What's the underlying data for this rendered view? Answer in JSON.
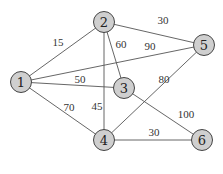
{
  "diagram": {
    "type": "weighted-undirected-graph",
    "colors": {
      "node_fill": "#cfcfcf",
      "node_stroke": "#444444",
      "edge": "#555555",
      "text": "#222222"
    },
    "nodes": [
      {
        "id": "1",
        "label": "1",
        "x": 21,
        "y": 82
      },
      {
        "id": "2",
        "label": "2",
        "x": 104,
        "y": 22
      },
      {
        "id": "3",
        "label": "3",
        "x": 124,
        "y": 88
      },
      {
        "id": "4",
        "label": "4",
        "x": 104,
        "y": 140
      },
      {
        "id": "5",
        "label": "5",
        "x": 204,
        "y": 45
      },
      {
        "id": "6",
        "label": "6",
        "x": 202,
        "y": 140
      }
    ],
    "edges": [
      {
        "from": "1",
        "to": "2",
        "weight": "15",
        "label_x": 58,
        "label_y": 42
      },
      {
        "from": "2",
        "to": "5",
        "weight": "30",
        "label_x": 163,
        "label_y": 20
      },
      {
        "from": "2",
        "to": "3",
        "weight": "60",
        "label_x": 121,
        "label_y": 44
      },
      {
        "from": "1",
        "to": "5",
        "weight": "90",
        "label_x": 150,
        "label_y": 46
      },
      {
        "from": "1",
        "to": "3",
        "weight": "50",
        "label_x": 80,
        "label_y": 79
      },
      {
        "from": "4",
        "to": "5",
        "weight": "80",
        "label_x": 164,
        "label_y": 79
      },
      {
        "from": "1",
        "to": "4",
        "weight": "70",
        "label_x": 69,
        "label_y": 107
      },
      {
        "from": "2",
        "to": "4",
        "weight": "45",
        "label_x": 97,
        "label_y": 106
      },
      {
        "from": "3",
        "to": "6",
        "weight": "100",
        "label_x": 186,
        "label_y": 114
      },
      {
        "from": "4",
        "to": "6",
        "weight": "30",
        "label_x": 154,
        "label_y": 132
      }
    ]
  }
}
